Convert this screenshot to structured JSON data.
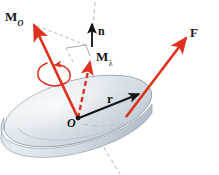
{
  "figure": {
    "background_color": "#ffffff",
    "width": 219,
    "height": 175
  },
  "colors": {
    "vector_red": "#e0301e",
    "vector_red_dark": "#c42a1c",
    "vector_black": "#141414",
    "disk_top_light": "#eef2f6",
    "disk_top_mid": "#ccd6de",
    "disk_top_shadow": "#b9c5cf",
    "disk_rim": "#8d9aa6",
    "disk_edge_side": "#dde4ea",
    "axis_dash_gray": "#b0b0b0",
    "construction_gray": "#9a9a9a",
    "label_color": "#141414"
  },
  "labels": {
    "moment_about_point": {
      "symbol": "M",
      "subscript": "O",
      "name": "M_O"
    },
    "unit_normal": {
      "symbol": "n",
      "subscript": "",
      "name": "n"
    },
    "moment_about_axis": {
      "symbol": "M",
      "subscript": "λ",
      "name": "M_lambda"
    },
    "force": {
      "symbol": "F",
      "subscript": "",
      "name": "F"
    },
    "position_vector": {
      "symbol": "r",
      "subscript": "",
      "name": "r"
    },
    "origin_point": {
      "symbol": "O",
      "subscript": "",
      "name": "O"
    }
  },
  "elements": {
    "disk": {
      "name": "disk-body",
      "shape": "ellipse-3d",
      "fill": "#ccd6de"
    },
    "origin_dot": {
      "name": "origin-point-dot",
      "fill": "#141414"
    },
    "axis_line": {
      "name": "axis-lambda-dashed-line",
      "style": "dashed",
      "color": "#b0b0b0"
    },
    "rotation_curl": {
      "name": "rotation-curl-arrow",
      "color": "#e0301e"
    },
    "projection_construction": {
      "name": "projection-construction-lines",
      "color": "#9a9a9a"
    },
    "disk_diameter_dashes": {
      "name": "disk-diameter-dashed-line",
      "color": "#b9c5cf"
    }
  },
  "vectors": [
    {
      "name": "vector-Mo",
      "label": "M_O",
      "color": "#e0301e",
      "style": "solid",
      "from": [
        78,
        118
      ],
      "to": [
        32,
        22
      ]
    },
    {
      "name": "vector-Mlambda",
      "label": "M_lambda",
      "color": "#e0301e",
      "style": "dashed",
      "from": [
        78,
        118
      ],
      "to": [
        91,
        58
      ]
    },
    {
      "name": "vector-n",
      "label": "n",
      "color": "#141414",
      "style": "solid",
      "from": [
        92,
        46
      ],
      "to": [
        92,
        22
      ]
    },
    {
      "name": "vector-F",
      "label": "F",
      "color": "#e0301e",
      "style": "solid",
      "from": [
        130,
        111
      ],
      "to": [
        188,
        36
      ]
    },
    {
      "name": "vector-r",
      "label": "r",
      "color": "#141414",
      "style": "solid",
      "from": [
        78,
        118
      ],
      "to": [
        141,
        93
      ]
    }
  ]
}
